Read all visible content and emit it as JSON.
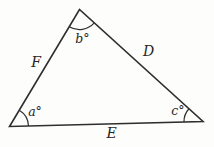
{
  "diagram": {
    "type": "triangle-geometry-figure",
    "background_color": "#fdfdfc",
    "line_color": "#2e2e2e",
    "text_color": "#262626",
    "angle_labels": {
      "bottom_left": "a°",
      "top": "b°",
      "bottom_right": "c°"
    },
    "side_labels": {
      "left": "F",
      "right": "D",
      "bottom": "E"
    }
  }
}
